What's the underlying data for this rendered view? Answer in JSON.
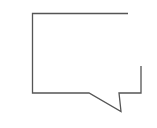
{
  "icon": {
    "name": "speech-bubble-icon",
    "stroke_color": "#555555",
    "background": "#ffffff"
  }
}
